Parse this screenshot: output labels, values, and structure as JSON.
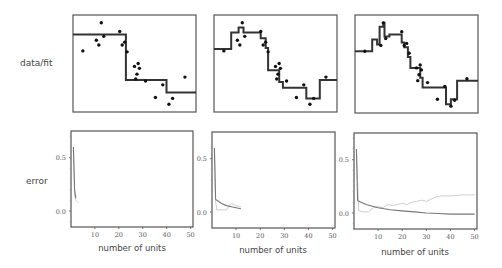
{
  "row_labels": {
    "top": "data/fit",
    "bottom": "error"
  },
  "colors": {
    "frame": "#555555",
    "fit": "#333333",
    "points": "#111111",
    "error_dark": "#777777",
    "error_light": "#c8c8c8"
  },
  "chart_data": [
    {
      "type": "scatter",
      "title": "data/fit panel 1",
      "note": "coordinates normalized 0-1 within plot frame (x left->right, y top->bottom)",
      "points": [
        [
          0.08,
          0.37
        ],
        [
          0.23,
          0.08
        ],
        [
          0.19,
          0.26
        ],
        [
          0.21,
          0.31
        ],
        [
          0.25,
          0.22
        ],
        [
          0.38,
          0.17
        ],
        [
          0.4,
          0.31
        ],
        [
          0.42,
          0.28
        ],
        [
          0.44,
          0.38
        ],
        [
          0.5,
          0.53
        ],
        [
          0.53,
          0.5
        ],
        [
          0.54,
          0.55
        ],
        [
          0.52,
          0.61
        ],
        [
          0.51,
          0.66
        ],
        [
          0.59,
          0.68
        ],
        [
          0.73,
          0.72
        ],
        [
          0.67,
          0.85
        ],
        [
          0.78,
          0.92
        ],
        [
          0.81,
          0.86
        ],
        [
          0.91,
          0.64
        ]
      ],
      "fit_steps": [
        [
          0,
          0.2
        ],
        [
          0.43,
          0.2
        ],
        [
          0.43,
          0.67
        ],
        [
          0.76,
          0.67
        ],
        [
          0.76,
          0.8
        ],
        [
          1,
          0.8
        ]
      ]
    },
    {
      "type": "scatter",
      "title": "data/fit panel 2",
      "points": [
        [
          0.08,
          0.37
        ],
        [
          0.23,
          0.08
        ],
        [
          0.19,
          0.26
        ],
        [
          0.21,
          0.31
        ],
        [
          0.25,
          0.22
        ],
        [
          0.38,
          0.17
        ],
        [
          0.4,
          0.31
        ],
        [
          0.42,
          0.28
        ],
        [
          0.44,
          0.38
        ],
        [
          0.5,
          0.53
        ],
        [
          0.53,
          0.5
        ],
        [
          0.54,
          0.55
        ],
        [
          0.52,
          0.61
        ],
        [
          0.51,
          0.66
        ],
        [
          0.59,
          0.68
        ],
        [
          0.73,
          0.72
        ],
        [
          0.67,
          0.85
        ],
        [
          0.78,
          0.92
        ],
        [
          0.81,
          0.86
        ],
        [
          0.91,
          0.64
        ]
      ],
      "fit_steps": [
        [
          0,
          0.35
        ],
        [
          0.14,
          0.35
        ],
        [
          0.14,
          0.18
        ],
        [
          0.2,
          0.18
        ],
        [
          0.2,
          0.13
        ],
        [
          0.24,
          0.13
        ],
        [
          0.24,
          0.18
        ],
        [
          0.38,
          0.18
        ],
        [
          0.38,
          0.24
        ],
        [
          0.42,
          0.24
        ],
        [
          0.42,
          0.34
        ],
        [
          0.44,
          0.34
        ],
        [
          0.44,
          0.57
        ],
        [
          0.53,
          0.57
        ],
        [
          0.53,
          0.69
        ],
        [
          0.56,
          0.69
        ],
        [
          0.56,
          0.75
        ],
        [
          0.75,
          0.75
        ],
        [
          0.75,
          0.86
        ],
        [
          0.86,
          0.86
        ],
        [
          0.86,
          0.67
        ],
        [
          1,
          0.67
        ]
      ]
    },
    {
      "type": "scatter",
      "title": "data/fit panel 3",
      "points": [
        [
          0.08,
          0.37
        ],
        [
          0.23,
          0.08
        ],
        [
          0.21,
          0.31
        ],
        [
          0.25,
          0.24
        ],
        [
          0.38,
          0.17
        ],
        [
          0.4,
          0.31
        ],
        [
          0.42,
          0.29
        ],
        [
          0.44,
          0.39
        ],
        [
          0.5,
          0.54
        ],
        [
          0.53,
          0.51
        ],
        [
          0.54,
          0.56
        ],
        [
          0.52,
          0.61
        ],
        [
          0.51,
          0.67
        ],
        [
          0.59,
          0.69
        ],
        [
          0.73,
          0.73
        ],
        [
          0.67,
          0.86
        ],
        [
          0.78,
          0.93
        ],
        [
          0.81,
          0.87
        ],
        [
          0.91,
          0.65
        ]
      ],
      "fit_steps": [
        [
          0,
          0.37
        ],
        [
          0.14,
          0.37
        ],
        [
          0.14,
          0.25
        ],
        [
          0.18,
          0.25
        ],
        [
          0.18,
          0.3
        ],
        [
          0.2,
          0.3
        ],
        [
          0.2,
          0.12
        ],
        [
          0.23,
          0.12
        ],
        [
          0.23,
          0.08
        ],
        [
          0.24,
          0.08
        ],
        [
          0.24,
          0.22
        ],
        [
          0.28,
          0.22
        ],
        [
          0.28,
          0.2
        ],
        [
          0.38,
          0.2
        ],
        [
          0.38,
          0.28
        ],
        [
          0.4,
          0.28
        ],
        [
          0.4,
          0.33
        ],
        [
          0.43,
          0.33
        ],
        [
          0.43,
          0.43
        ],
        [
          0.45,
          0.43
        ],
        [
          0.45,
          0.54
        ],
        [
          0.53,
          0.54
        ],
        [
          0.53,
          0.64
        ],
        [
          0.55,
          0.64
        ],
        [
          0.55,
          0.74
        ],
        [
          0.74,
          0.74
        ],
        [
          0.74,
          0.91
        ],
        [
          0.78,
          0.91
        ],
        [
          0.78,
          0.86
        ],
        [
          0.83,
          0.86
        ],
        [
          0.83,
          0.67
        ],
        [
          1,
          0.67
        ]
      ]
    },
    {
      "type": "line",
      "title": "error panel 1",
      "xlabel": "number of units",
      "ylabel": "error",
      "xlim": [
        0,
        51
      ],
      "ylim": [
        -0.15,
        0.75
      ],
      "xticks": [
        10,
        20,
        30,
        40,
        50
      ],
      "yticks": [
        0.0,
        0.5
      ],
      "series": [
        {
          "name": "training error",
          "color": "#777777",
          "x": [
            1,
            1.5,
            2
          ],
          "y": [
            0.6,
            0.2,
            0.12
          ]
        },
        {
          "name": "test error",
          "color": "#c8c8c8",
          "x": [
            1,
            1.5,
            2,
            2.5,
            3
          ],
          "y": [
            0.6,
            0.15,
            0.1,
            0.09,
            0.08
          ]
        }
      ]
    },
    {
      "type": "line",
      "title": "error panel 2",
      "xlabel": "number of units",
      "xlim": [
        0,
        51
      ],
      "ylim": [
        -0.15,
        0.75
      ],
      "xticks": [
        10,
        20,
        30,
        40,
        50
      ],
      "yticks": [
        0.0,
        0.5
      ],
      "series": [
        {
          "name": "training error",
          "color": "#777777",
          "x": [
            1,
            1.5,
            2,
            4,
            6,
            8,
            10,
            12
          ],
          "y": [
            0.6,
            0.12,
            0.11,
            0.08,
            0.06,
            0.05,
            0.04,
            0.03
          ]
        },
        {
          "name": "test error",
          "color": "#c8c8c8",
          "x": [
            1,
            1.5,
            2,
            4,
            6,
            7,
            8,
            10,
            12
          ],
          "y": [
            0.6,
            0.1,
            0.02,
            0.02,
            0.02,
            0.05,
            0.08,
            0.06,
            0.05
          ]
        }
      ]
    },
    {
      "type": "line",
      "title": "error panel 3",
      "xlabel": "number of units",
      "xlim": [
        0,
        51
      ],
      "ylim": [
        -0.15,
        0.75
      ],
      "xticks": [
        10,
        20,
        30,
        40,
        50
      ],
      "yticks": [
        0.0,
        0.5
      ],
      "series": [
        {
          "name": "training error",
          "color": "#777777",
          "x": [
            1,
            1.5,
            2,
            5,
            10,
            15,
            20,
            25,
            30,
            35,
            40,
            45,
            50
          ],
          "y": [
            0.6,
            0.12,
            0.11,
            0.08,
            0.05,
            0.03,
            0.02,
            0.01,
            0.0,
            -0.005,
            -0.01,
            -0.01,
            -0.01
          ]
        },
        {
          "name": "test error",
          "color": "#c8c8c8",
          "x": [
            1,
            2,
            4,
            6,
            8,
            10,
            12,
            14,
            16,
            18,
            20,
            22,
            24,
            26,
            28,
            30,
            32,
            34,
            36,
            40,
            45,
            50
          ],
          "y": [
            0.6,
            0.02,
            0.01,
            0.01,
            0.05,
            0.06,
            0.05,
            0.08,
            0.07,
            0.08,
            0.09,
            0.08,
            0.1,
            0.11,
            0.12,
            0.11,
            0.13,
            0.15,
            0.16,
            0.16,
            0.17,
            0.17
          ]
        }
      ]
    }
  ]
}
